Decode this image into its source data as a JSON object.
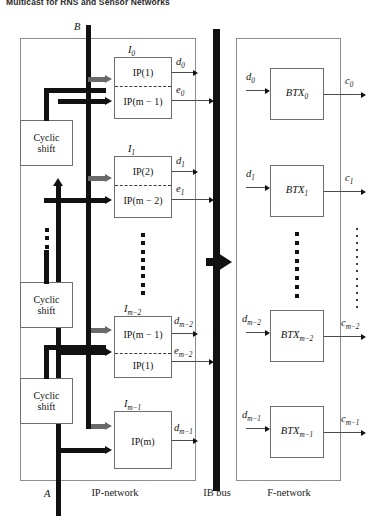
{
  "running_head": "Multicast for RNS and Sensor Networks",
  "inputs": {
    "top_label": "B",
    "bottom_label": "A"
  },
  "panels": [
    {
      "name": "ip-network",
      "label": "IP-network"
    },
    {
      "name": "ib-bus",
      "label": "IB bus"
    },
    {
      "name": "f-network",
      "label": "F-network"
    }
  ],
  "cyclic_shift": {
    "line1": "Cyclic",
    "line2": "shift",
    "count": 3
  },
  "ip_blocks": [
    {
      "id": "I0",
      "label_base": "I",
      "label_sub": "0",
      "cells": [
        "IP(1)",
        "IP(m − 1)"
      ],
      "divider": true,
      "outputs": [
        {
          "name": "d0",
          "base": "d",
          "sub": "0",
          "to_bus": false
        },
        {
          "name": "e0",
          "base": "e",
          "sub": "0",
          "to_bus": true
        }
      ]
    },
    {
      "id": "I1",
      "label_base": "I",
      "label_sub": "1",
      "cells": [
        "IP(2)",
        "IP(m − 2)"
      ],
      "divider": true,
      "outputs": [
        {
          "name": "d1",
          "base": "d",
          "sub": "1",
          "to_bus": false
        },
        {
          "name": "e1",
          "base": "e",
          "sub": "1",
          "to_bus": true
        }
      ]
    },
    {
      "id": "Im-2",
      "label_base": "I",
      "label_sub": "m−2",
      "cells": [
        "IP(m − 1)",
        "IP(1)"
      ],
      "divider": true,
      "outputs": [
        {
          "name": "dm-2",
          "base": "d",
          "sub": "m−2",
          "to_bus": false
        },
        {
          "name": "em-2",
          "base": "e",
          "sub": "m−2",
          "to_bus": true
        }
      ]
    },
    {
      "id": "Im-1",
      "label_base": "I",
      "label_sub": "m−1",
      "cells": [
        "IP(m)"
      ],
      "divider": false,
      "outputs": [
        {
          "name": "dm-1",
          "base": "d",
          "sub": "m−1",
          "to_bus": false
        }
      ]
    }
  ],
  "f_blocks": [
    {
      "id": "BTX0",
      "label_base": "BTX",
      "label_sub": "0",
      "input": {
        "base": "d",
        "sub": "0"
      },
      "output": {
        "base": "c",
        "sub": "0"
      }
    },
    {
      "id": "BTX1",
      "label_base": "BTX",
      "label_sub": "1",
      "input": {
        "base": "d",
        "sub": "1"
      },
      "output": {
        "base": "c",
        "sub": "1"
      }
    },
    {
      "id": "BTXm-2",
      "label_base": "BTX",
      "label_sub": "m−2",
      "input": {
        "base": "d",
        "sub": "m−2"
      },
      "output": {
        "base": "c",
        "sub": "m−2"
      }
    },
    {
      "id": "BTXm-1",
      "label_base": "BTX",
      "label_sub": "m−1",
      "input": {
        "base": "d",
        "sub": "m−1"
      },
      "output": {
        "base": "c",
        "sub": "m−1"
      }
    }
  ],
  "colors": {
    "line": "#111111",
    "gray_arrow": "#6a6a6a",
    "panel_border": "#8d8d8d",
    "block_border": "#6e6e6e",
    "background": "#ffffff"
  }
}
